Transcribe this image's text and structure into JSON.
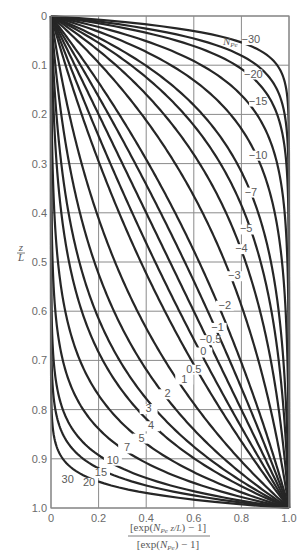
{
  "chart_data": {
    "type": "line",
    "title": "",
    "xlabel_numerator": "[exp(N_Pe z/L) − 1]",
    "xlabel_denominator": "[exp(N_Pe) − 1]",
    "ylabel": "z/L",
    "legend_title": "N_Pe",
    "xlim": [
      0,
      1.0
    ],
    "ylim": [
      0,
      1.0
    ],
    "y_inverted": true,
    "grid": true,
    "x_ticks": [
      "0",
      "0.2",
      "0.4",
      "0.6",
      "0.8",
      "1.0"
    ],
    "y_ticks": [
      "0",
      "0.1",
      "0.2",
      "0.3",
      "0.4",
      "0.5",
      "0.6",
      "0.7",
      "0.8",
      "0.9",
      "1.0"
    ],
    "formula": "x = (exp(N_Pe * z) - 1) / (exp(N_Pe) - 1)",
    "series": [
      {
        "name": "-30",
        "N": -30,
        "label_pos": [
          0.84,
          0.055
        ]
      },
      {
        "name": "-20",
        "N": -20,
        "label_pos": [
          0.85,
          0.125
        ]
      },
      {
        "name": "-15",
        "N": -15,
        "label_pos": [
          0.87,
          0.18
        ]
      },
      {
        "name": "-10",
        "N": -10,
        "label_pos": [
          0.87,
          0.29
        ]
      },
      {
        "name": "-7",
        "N": -7,
        "label_pos": [
          0.84,
          0.365
        ]
      },
      {
        "name": "-5",
        "N": -5,
        "label_pos": [
          0.82,
          0.44
        ]
      },
      {
        "name": "-4",
        "N": -4,
        "label_pos": [
          0.8,
          0.48
        ]
      },
      {
        "name": "-3",
        "N": -3,
        "label_pos": [
          0.77,
          0.535
        ]
      },
      {
        "name": "-2",
        "N": -2,
        "label_pos": [
          0.73,
          0.595
        ]
      },
      {
        "name": "-1",
        "N": -1,
        "label_pos": [
          0.7,
          0.64
        ]
      },
      {
        "name": "-0.5",
        "N": -0.5,
        "label_pos": [
          0.67,
          0.665
        ]
      },
      {
        "name": "0",
        "N": 0,
        "label_pos": [
          0.64,
          0.69
        ]
      },
      {
        "name": "0.5",
        "N": 0.5,
        "label_pos": [
          0.6,
          0.725
        ]
      },
      {
        "name": "1",
        "N": 1,
        "label_pos": [
          0.56,
          0.745
        ]
      },
      {
        "name": "2",
        "N": 2,
        "label_pos": [
          0.49,
          0.775
        ]
      },
      {
        "name": "3",
        "N": 3,
        "label_pos": [
          0.41,
          0.805
        ]
      },
      {
        "name": "4",
        "N": 4,
        "label_pos": [
          0.42,
          0.84
        ]
      },
      {
        "name": "5",
        "N": 5,
        "label_pos": [
          0.38,
          0.865
        ]
      },
      {
        "name": "7",
        "N": 7,
        "label_pos": [
          0.32,
          0.885
        ]
      },
      {
        "name": "10",
        "N": 10,
        "label_pos": [
          0.26,
          0.91
        ]
      },
      {
        "name": "15",
        "N": 15,
        "label_pos": [
          0.21,
          0.935
        ]
      },
      {
        "name": "20",
        "N": 20,
        "label_pos": [
          0.16,
          0.955
        ]
      },
      {
        "name": "30",
        "N": 30,
        "label_pos": [
          0.07,
          0.95
        ]
      }
    ]
  },
  "layout": {
    "plot_left": 51,
    "plot_right": 289,
    "plot_top": 16,
    "plot_bottom": 508,
    "grid_color": "#8a8a8a",
    "curve_color": "#262626"
  }
}
